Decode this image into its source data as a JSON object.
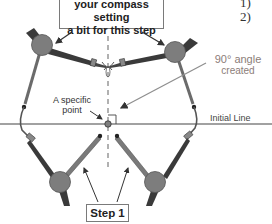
{
  "top_callout": {
    "line1": "your compass setting",
    "line2": "a bit for this step"
  },
  "labels": {
    "specific_point_line1": "A specific",
    "specific_point_line2": "point",
    "initial_line": "Initial Line",
    "angle_line1": "90° angle",
    "angle_line2": "created",
    "step": "Step 1"
  },
  "list_markers": [
    "1)",
    "2)"
  ],
  "colors": {
    "compass_hinge": "#7d7d7d",
    "compass_leg_dark": "#3a3a3a",
    "compass_leg_gray": "#6b6b6b",
    "arrow": "#333333",
    "angle_pointer": "#8f8f8f",
    "angle_text": "#8c7d78",
    "line": "#444444"
  }
}
